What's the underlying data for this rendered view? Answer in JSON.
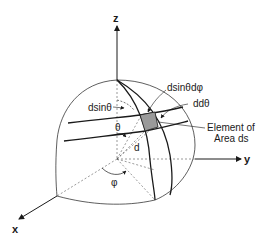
{
  "diagram": {
    "type": "spherical-coordinates-area-element",
    "axes": {
      "z_label": "z",
      "y_label": "y",
      "x_label": "x"
    },
    "labels": {
      "d_sin_theta_d_phi": "dsinθdφ",
      "d_d_theta": "ddθ",
      "d_sin_theta": "dsinθ",
      "theta": "θ",
      "phi": "φ",
      "radius": "d",
      "element_line1": "Element of",
      "element_line2": "Area ds"
    },
    "colors": {
      "line": "#1a1a1a",
      "shaded_element": "#9a9a9a",
      "background": "#ffffff"
    }
  }
}
